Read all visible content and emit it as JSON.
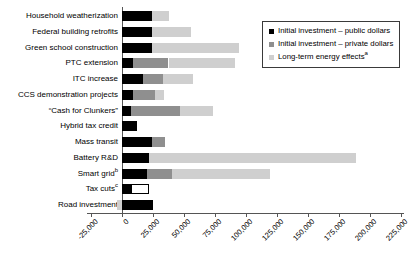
{
  "chart_data": {
    "type": "bar",
    "orientation": "horizontal",
    "stacked": true,
    "title": "",
    "xlabel": "",
    "ylabel": "",
    "grid": false,
    "legend_position": "top-right",
    "x_range": [
      -25000,
      225000
    ],
    "x_tick_values": [
      -25000,
      0,
      25000,
      50000,
      75000,
      100000,
      125000,
      150000,
      175000,
      200000,
      225000
    ],
    "x_tick_labels": [
      "-25,000",
      "0",
      "25,000",
      "50,000",
      "75,000",
      "100,000",
      "125,000",
      "150,000",
      "175,000",
      "200,000",
      "225,000"
    ],
    "legend": [
      {
        "label": "Initial investment – public dollars",
        "color": "#000000"
      },
      {
        "label": "Initial investment – private dollars",
        "color": "#8f8f8f"
      },
      {
        "label": "Long-term energy effects",
        "sup": "a",
        "color": "#cfcfcf"
      }
    ],
    "categories": [
      {
        "label": "Household weatherization"
      },
      {
        "label": "Federal building retrofits"
      },
      {
        "label": "Green school construction"
      },
      {
        "label": "PTC extension"
      },
      {
        "label": "ITC increase"
      },
      {
        "label": "CCS demonstration projects"
      },
      {
        "label": "“Cash for Clunkers”"
      },
      {
        "label": "Hybrid tax credit"
      },
      {
        "label": "Mass transit"
      },
      {
        "label": "Battery R&D"
      },
      {
        "label": "Smart grid",
        "sup": "b"
      },
      {
        "label": "Tax cuts",
        "sup": "c"
      },
      {
        "label": "Road investment"
      }
    ],
    "series": [
      {
        "name": "Initial investment – public dollars",
        "color": "#000000",
        "values": [
          24000,
          24000,
          24000,
          9000,
          17000,
          9000,
          7000,
          12000,
          24000,
          22000,
          20000,
          7500,
          25000
        ]
      },
      {
        "name": "Initial investment – private dollars",
        "color": "#8f8f8f",
        "values": [
          0,
          0,
          0,
          28500,
          16000,
          17500,
          39500,
          0,
          10500,
          0,
          20000,
          0,
          0
        ]
      },
      {
        "name": "Long-term energy effects",
        "color": "#cfcfcf",
        "values": [
          14000,
          32000,
          70000,
          53500,
          24000,
          7500,
          27000,
          0,
          0,
          167000,
          79000,
          0,
          -4000
        ]
      },
      {
        "name": "Unlabeled (white outlined)",
        "color": "#ffffff",
        "outlined": true,
        "values": [
          0,
          0,
          0,
          0,
          0,
          0,
          0,
          0,
          0,
          0,
          0,
          14500,
          0
        ]
      }
    ]
  }
}
